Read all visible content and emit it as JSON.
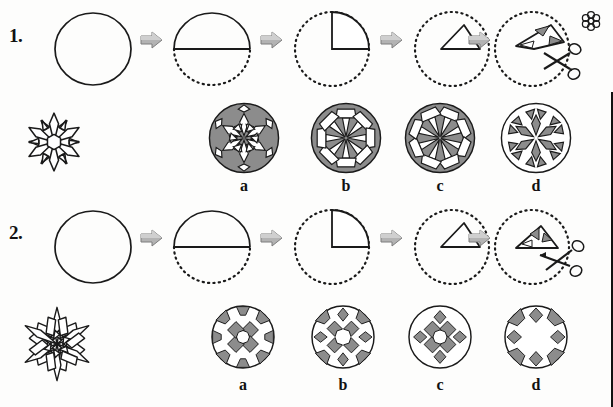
{
  "page": {
    "background_color": "#fdfdfc",
    "ink_color": "#1a1a1a",
    "shade_color": "#8c8c8c",
    "arrow_color": "#9a9a9a"
  },
  "decoration": {
    "corner_rosette_name": "rosette-flower-icon"
  },
  "rows": [
    {
      "number": "1.",
      "name": "row-1",
      "steps": [
        {
          "name": "step-circle",
          "label": "circle"
        },
        {
          "name": "step-half-fold",
          "label": "half fold"
        },
        {
          "name": "step-quarter-fold",
          "label": "quarter fold"
        },
        {
          "name": "step-triangle-fold",
          "label": "triangle fold"
        },
        {
          "name": "step-cut",
          "label": "cut with scissors"
        }
      ],
      "arrows": [
        "arrow-1",
        "arrow-2",
        "arrow-3",
        "arrow-4"
      ],
      "result_snowflake": {
        "name": "snowflake-result-1",
        "points": 6
      },
      "options": [
        {
          "letter": "a",
          "name": "option-a",
          "pattern": "star-burst-petals"
        },
        {
          "letter": "b",
          "name": "option-b",
          "pattern": "spoked-wheel-blocks"
        },
        {
          "letter": "c",
          "name": "option-c",
          "pattern": "spoked-wheel-blocks-alt"
        },
        {
          "letter": "d",
          "name": "option-d",
          "pattern": "open-petal-rosette"
        }
      ]
    },
    {
      "number": "2.",
      "name": "row-2",
      "steps": [
        {
          "name": "step-circle",
          "label": "circle"
        },
        {
          "name": "step-half-fold",
          "label": "half fold"
        },
        {
          "name": "step-quarter-fold",
          "label": "quarter fold"
        },
        {
          "name": "step-triangle-fold",
          "label": "triangle fold"
        },
        {
          "name": "step-cut",
          "label": "cut with scissors"
        }
      ],
      "arrows": [
        "arrow-1",
        "arrow-2",
        "arrow-3",
        "arrow-4"
      ],
      "result_snowflake": {
        "name": "snowflake-result-2",
        "points": 6
      },
      "options": [
        {
          "letter": "a",
          "name": "option-a",
          "pattern": "square-and-wedge-ring"
        },
        {
          "letter": "b",
          "name": "option-b",
          "pattern": "dense-diamond-ring"
        },
        {
          "letter": "c",
          "name": "option-c",
          "pattern": "sparse-square-ring"
        },
        {
          "letter": "d",
          "name": "option-d",
          "pattern": "edge-wedge-diamond-ring"
        }
      ]
    }
  ]
}
